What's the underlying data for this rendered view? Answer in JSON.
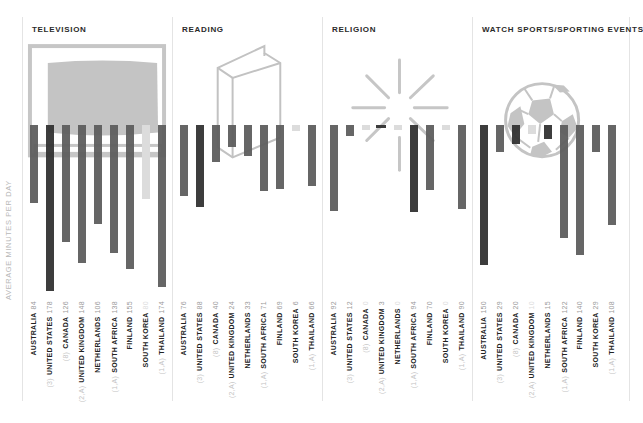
{
  "y_axis_label": "AVERAGE MINUTES PER DAY",
  "colors": {
    "dark": "#333333",
    "mid": "#5e5e5e",
    "light": "#dcdcdc",
    "illustration": "#c2c2c2"
  },
  "panels": [
    {
      "title": "TELEVISION",
      "illustration": "television-icon"
    },
    {
      "title": "READING",
      "illustration": "book-icon"
    },
    {
      "title": "RELIGION",
      "illustration": "starburst-icon"
    },
    {
      "title": "WATCH SPORTS/SPORTING EVENTS",
      "illustration": "soccer-ball-icon"
    }
  ],
  "countries": [
    {
      "code": "",
      "name": "AUSTRALIA"
    },
    {
      "code": "(3)",
      "name": "UNITED STATES"
    },
    {
      "code": "(8)",
      "name": "CANADA"
    },
    {
      "code": "(2,A)",
      "name": "UNITED KINGDOM"
    },
    {
      "code": "",
      "name": "NETHERLANDS"
    },
    {
      "code": "(1,A)",
      "name": "SOUTH AFRICA"
    },
    {
      "code": "",
      "name": "FINLAND"
    },
    {
      "code": "",
      "name": "SOUTH KOREA"
    },
    {
      "code": "(1,A)",
      "name": "THAILAND"
    }
  ],
  "chart_data": [
    {
      "type": "bar",
      "title": "TELEVISION",
      "ylabel": "AVERAGE MINUTES PER DAY",
      "categories": [
        "AUSTRALIA",
        "UNITED STATES",
        "CANADA",
        "UNITED KINGDOM",
        "NETHERLANDS",
        "SOUTH AFRICA",
        "FINLAND",
        "SOUTH KOREA",
        "THAILAND"
      ],
      "values": [
        84,
        178,
        126,
        148,
        106,
        138,
        155,
        80,
        174
      ],
      "value_labels": [
        "84",
        "178",
        "126",
        "148",
        "106",
        "138",
        "155",
        "80",
        "174"
      ],
      "orientation": "downward"
    },
    {
      "type": "bar",
      "title": "READING",
      "ylabel": "AVERAGE MINUTES PER DAY",
      "categories": [
        "AUSTRALIA",
        "UNITED STATES",
        "CANADA",
        "UNITED KINGDOM",
        "NETHERLANDS",
        "SOUTH AFRICA",
        "FINLAND",
        "SOUTH KOREA",
        "THAILAND"
      ],
      "values": [
        76,
        88,
        40,
        24,
        33,
        71,
        69,
        6,
        66
      ],
      "value_labels": [
        "76",
        "88",
        "40",
        "24",
        "33",
        "71",
        "69",
        "6",
        "66"
      ],
      "orientation": "downward"
    },
    {
      "type": "bar",
      "title": "RELIGION",
      "ylabel": "AVERAGE MINUTES PER DAY",
      "categories": [
        "AUSTRALIA",
        "UNITED STATES",
        "CANADA",
        "UNITED KINGDOM",
        "NETHERLANDS",
        "SOUTH AFRICA",
        "FINLAND",
        "SOUTH KOREA",
        "THAILAND"
      ],
      "values": [
        92,
        12,
        0,
        3,
        0,
        94,
        70,
        0,
        90
      ],
      "value_labels": [
        "92",
        "12",
        "0",
        "3",
        "0",
        "94",
        "70",
        "0",
        "90"
      ],
      "orientation": "downward"
    },
    {
      "type": "bar",
      "title": "WATCH SPORTS/SPORTING EVENTS",
      "ylabel": "AVERAGE MINUTES PER DAY",
      "categories": [
        "AUSTRALIA",
        "UNITED STATES",
        "CANADA",
        "UNITED KINGDOM",
        "NETHERLANDS",
        "SOUTH AFRICA",
        "FINLAND",
        "SOUTH KOREA",
        "THAILAND"
      ],
      "values": [
        150,
        29,
        20,
        10,
        15,
        122,
        140,
        29,
        108
      ],
      "value_labels": [
        "150",
        "29",
        "20",
        "10",
        "15",
        "122",
        "140",
        "29",
        "108"
      ],
      "orientation": "downward"
    }
  ],
  "bar_shades": [
    [
      "mid",
      "dark",
      "mid",
      "mid",
      "mid",
      "mid",
      "mid",
      "light",
      "mid"
    ],
    [
      "mid",
      "dark",
      "mid",
      "mid",
      "mid",
      "mid",
      "mid",
      "light",
      "mid"
    ],
    [
      "mid",
      "mid",
      "light",
      "dark",
      "light",
      "dark",
      "mid",
      "light",
      "mid"
    ],
    [
      "dark",
      "mid",
      "dark",
      "light",
      "dark",
      "mid",
      "mid",
      "mid",
      "mid"
    ]
  ]
}
